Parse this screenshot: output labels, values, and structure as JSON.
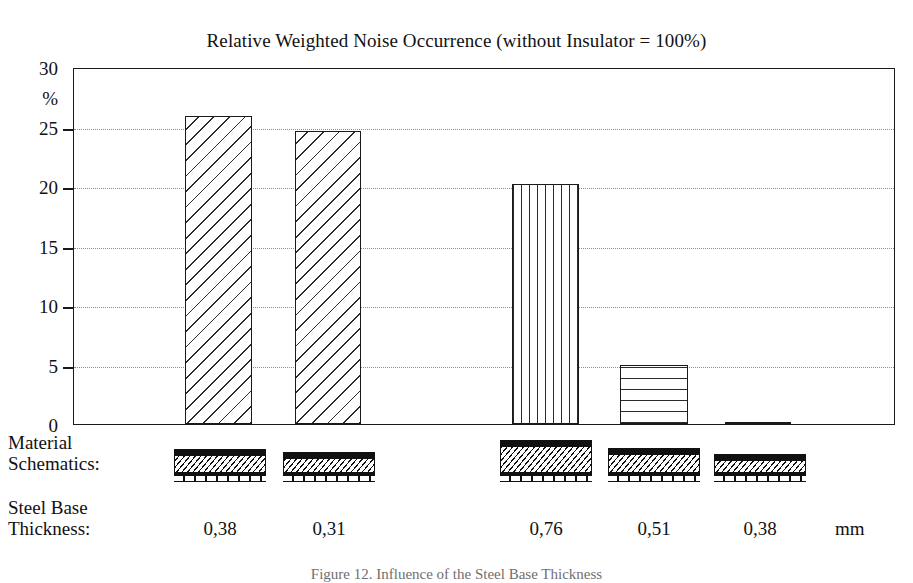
{
  "chart_data": {
    "type": "bar",
    "title": "Relative Weighted Noise Occurrence (without Insulator = 100%)",
    "xlabel": "",
    "ylabel": "%",
    "ylim": [
      0,
      30
    ],
    "yticks": [
      0,
      5,
      10,
      15,
      20,
      25,
      30
    ],
    "ytick_labels": [
      "0",
      "5",
      "10",
      "15",
      "20",
      "25",
      "30"
    ],
    "grid": true,
    "grid_axis": "y",
    "grid_style": "dotted",
    "legend": "none",
    "categories": [
      "0,38",
      "0,31",
      "0,76",
      "0,51",
      "0,38"
    ],
    "values": [
      25.9,
      24.6,
      20.2,
      5.0,
      0.2
    ],
    "bar_patterns": [
      "diagonal-hatch",
      "diagonal-hatch",
      "vertical-lines",
      "horizontal-lines",
      "solid-thin"
    ],
    "series": [
      {
        "name": "Relative Weighted Noise Occurrence",
        "values": [
          25.9,
          24.6,
          20.2,
          5.0,
          0.2
        ]
      }
    ],
    "annotations": [
      "Bars 1-2 are one material group (diagonal hatch); bars 3-5 are a second group (vertical, horizontal, near-zero).",
      "Each bar is paired with a layered material schematic and a steel base thickness in mm."
    ]
  },
  "axis": {
    "y_unit": "%",
    "y_labels": [
      "30",
      "25",
      "20",
      "15",
      "10",
      "5",
      "0"
    ]
  },
  "rows": {
    "material_line1": "Material",
    "material_line2": "Schematics:",
    "steel_line1": "Steel Base",
    "steel_line2": "Thickness:",
    "thickness_unit": "mm"
  },
  "thickness_values": [
    "0,38",
    "0,31",
    "0,76",
    "0,51",
    "0,38"
  ],
  "caption": "Figure 12. Influence of the Steel Base Thickness",
  "colors": {
    "ink": "#111111",
    "grid": "#8d8d8d",
    "background": "#ffffff"
  }
}
